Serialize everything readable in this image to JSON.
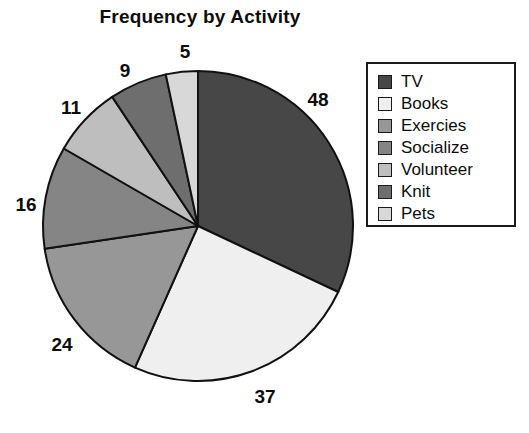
{
  "chart_data": {
    "type": "pie",
    "title": "Frequency by Activity",
    "xlabel": "",
    "ylabel": "",
    "total": 150,
    "legend_position": "right",
    "grid": false,
    "start_angle_deg": 0,
    "direction": "clockwise",
    "categories": [
      "TV",
      "Books",
      "Exercies",
      "Socialize",
      "Volunteer",
      "Knit",
      "Pets"
    ],
    "values": [
      48,
      37,
      24,
      16,
      11,
      9,
      5
    ],
    "colors": [
      "#474747",
      "#efefef",
      "#979797",
      "#858585",
      "#bebebe",
      "#6e6e6e",
      "#d8d8d8"
    ],
    "slices": [
      {
        "label": "TV",
        "value": 48,
        "value_text": "48",
        "color": "#474747",
        "start_deg": 0,
        "end_deg": 115.2,
        "label_x": 318,
        "label_y": 100
      },
      {
        "label": "Books",
        "value": 37,
        "value_text": "37",
        "color": "#efefef",
        "start_deg": 115.2,
        "end_deg": 204.0,
        "label_x": 265,
        "label_y": 397
      },
      {
        "label": "Exercies",
        "value": 24,
        "value_text": "24",
        "color": "#979797",
        "start_deg": 204.0,
        "end_deg": 261.6,
        "label_x": 62,
        "label_y": 345
      },
      {
        "label": "Socialize",
        "value": 16,
        "value_text": "16",
        "color": "#858585",
        "start_deg": 261.6,
        "end_deg": 300.0,
        "label_x": 26,
        "label_y": 205
      },
      {
        "label": "Volunteer",
        "value": 11,
        "value_text": "11",
        "color": "#bebebe",
        "start_deg": 300.0,
        "end_deg": 326.4,
        "label_x": 71,
        "label_y": 108
      },
      {
        "label": "Knit",
        "value": 9,
        "value_text": "9",
        "color": "#6e6e6e",
        "start_deg": 326.4,
        "end_deg": 348.0,
        "label_x": 125,
        "label_y": 71
      },
      {
        "label": "Pets",
        "value": 5,
        "value_text": "5",
        "color": "#d8d8d8",
        "start_deg": 348.0,
        "end_deg": 360.0,
        "label_x": 185,
        "label_y": 52
      }
    ],
    "geometry": {
      "center_x": 198,
      "center_y": 226,
      "radius": 155
    }
  },
  "legend": {
    "items": [
      {
        "label": "TV",
        "color": "#474747"
      },
      {
        "label": "Books",
        "color": "#efefef"
      },
      {
        "label": "Exercies",
        "color": "#979797"
      },
      {
        "label": "Socialize",
        "color": "#858585"
      },
      {
        "label": "Volunteer",
        "color": "#bebebe"
      },
      {
        "label": "Knit",
        "color": "#6e6e6e"
      },
      {
        "label": "Pets",
        "color": "#d8d8d8"
      }
    ]
  }
}
